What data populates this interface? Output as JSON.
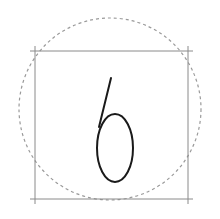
{
  "glyph": {
    "character": "6",
    "stroke_color": "#1a1a1a"
  },
  "guides": {
    "square_color": "#8a8a8a",
    "circle_color": "#9a9a9a",
    "circle_style": "dashed"
  }
}
